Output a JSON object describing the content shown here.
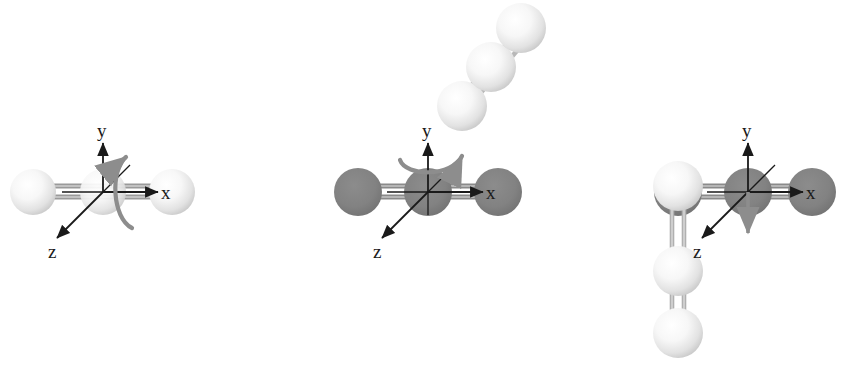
{
  "figure": {
    "background_color": "#ffffff",
    "width": 844,
    "height": 366,
    "colors": {
      "atom_light_core": "#ffffff",
      "atom_light_mid": "#f0f0f0",
      "atom_light_edge": "#cfcfcf",
      "atom_dark": "#808080",
      "atom_dark_edge": "#6e6e6e",
      "bond_gray": "#8d8d8d",
      "bond_light": "#d9d9d9",
      "axis_black": "#1a1a1a",
      "arrow_gray": "#8d8d8d"
    },
    "axis_labels": {
      "x": "x",
      "y": "y",
      "z": "z"
    }
  },
  "panels": [
    {
      "id": "panel-1",
      "name": "rotation-about-x-axis",
      "molecule_color": "light",
      "rotation_axis": "x",
      "rotation_arc_type": "vertical-curl",
      "axes_origin": {
        "x": 103,
        "y": 192
      },
      "axis_labels": {
        "x": "x",
        "y": "y",
        "z": "z"
      },
      "atoms": [
        {
          "cx": 33,
          "cy": 192,
          "r": 23,
          "shade": "light"
        },
        {
          "cx": 103,
          "cy": 192,
          "r": 23,
          "shade": "light"
        },
        {
          "cx": 172,
          "cy": 192,
          "r": 23,
          "shade": "light"
        }
      ],
      "bonds": [
        {
          "x1": 33,
          "y1": 192,
          "x2": 103,
          "y2": 192,
          "type": "double"
        },
        {
          "x1": 103,
          "y1": 192,
          "x2": 172,
          "y2": 192,
          "type": "double"
        }
      ],
      "result_molecule": null
    },
    {
      "id": "panel-2",
      "name": "rotation-about-y-axis",
      "molecule_color": "dark",
      "rotation_axis": "y",
      "rotation_arc_type": "horizontal-arc",
      "axes_origin": {
        "x": 428,
        "y": 192
      },
      "axis_labels": {
        "x": "x",
        "y": "y",
        "z": "z"
      },
      "atoms": [
        {
          "cx": 358,
          "cy": 192,
          "r": 24,
          "shade": "dark"
        },
        {
          "cx": 428,
          "cy": 192,
          "r": 24,
          "shade": "dark"
        },
        {
          "cx": 498,
          "cy": 192,
          "r": 24,
          "shade": "dark"
        }
      ],
      "bonds": [
        {
          "x1": 358,
          "y1": 192,
          "x2": 428,
          "y2": 192,
          "type": "double"
        },
        {
          "x1": 428,
          "y1": 192,
          "x2": 498,
          "y2": 192,
          "type": "double"
        }
      ],
      "result_molecule": {
        "shade": "light",
        "orientation_degrees": 50,
        "atoms": [
          {
            "cx": 462,
            "cy": 106,
            "r": 25,
            "shade": "light"
          },
          {
            "cx": 491,
            "cy": 67,
            "r": 25,
            "shade": "light"
          },
          {
            "cx": 521,
            "cy": 28,
            "r": 25,
            "shade": "light"
          }
        ],
        "bonds": [
          {
            "x1": 462,
            "y1": 106,
            "x2": 491,
            "y2": 67,
            "type": "double"
          },
          {
            "x1": 491,
            "y1": 67,
            "x2": 521,
            "y2": 28,
            "type": "double"
          }
        ]
      }
    },
    {
      "id": "panel-3",
      "name": "rotation-result-about-z-axis",
      "molecule_color": "dark",
      "rotation_axis": "z",
      "rotation_arc_type": "down-arrow",
      "axes_origin": {
        "x": 748,
        "y": 192
      },
      "axis_labels": {
        "x": "x",
        "y": "y",
        "z": "z"
      },
      "atoms": [
        {
          "cx": 678,
          "cy": 192,
          "r": 24,
          "shade": "dark"
        },
        {
          "cx": 748,
          "cy": 192,
          "r": 24,
          "shade": "dark"
        },
        {
          "cx": 812,
          "cy": 192,
          "r": 24,
          "shade": "dark"
        }
      ],
      "bonds": [
        {
          "x1": 678,
          "y1": 192,
          "x2": 748,
          "y2": 192,
          "type": "double"
        },
        {
          "x1": 748,
          "y1": 192,
          "x2": 812,
          "y2": 192,
          "type": "double"
        }
      ],
      "result_molecule": {
        "shade": "light",
        "orientation_degrees": 90,
        "atoms": [
          {
            "cx": 678,
            "cy": 186,
            "r": 25,
            "shade": "light"
          },
          {
            "cx": 678,
            "cy": 271,
            "r": 25,
            "shade": "light"
          },
          {
            "cx": 678,
            "cy": 333,
            "r": 25,
            "shade": "light"
          }
        ],
        "bonds": [
          {
            "x1": 678,
            "y1": 186,
            "x2": 678,
            "y2": 271,
            "type": "double"
          },
          {
            "x1": 678,
            "y1": 271,
            "x2": 678,
            "y2": 333,
            "type": "double"
          }
        ]
      }
    }
  ]
}
